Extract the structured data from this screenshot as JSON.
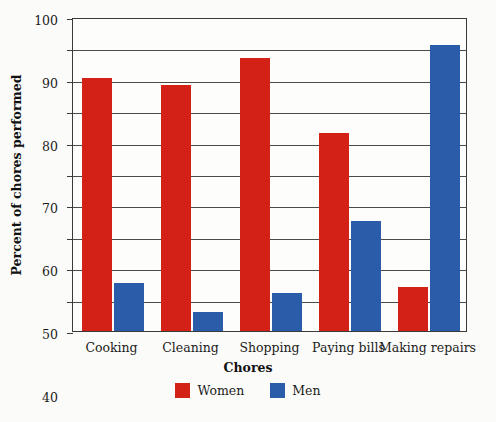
{
  "chart_data": {
    "type": "bar",
    "title": "",
    "xlabel": "Chores",
    "ylabel": "Percent of chores performed",
    "categories": [
      "Cooking",
      "Cleaning",
      "Shopping",
      "Paying bills",
      "Making repairs"
    ],
    "series": [
      {
        "name": "Women",
        "color": "#d32118",
        "values": [
          80.5,
          78.5,
          87,
          63,
          14
        ]
      },
      {
        "name": "Men",
        "color": "#2a5caa",
        "values": [
          15.3,
          6,
          12,
          35,
          91
        ]
      }
    ],
    "ylim": [
      0,
      100
    ],
    "yticks": [
      0,
      10,
      20,
      30,
      40,
      50,
      60,
      70,
      80,
      90,
      100
    ],
    "ytick_labels": [
      "0",
      "10",
      "20",
      "30",
      "40",
      "50",
      "60",
      "70",
      "80",
      "90",
      "100"
    ],
    "grid": "horizontal",
    "legend_position": "bottom-center"
  }
}
